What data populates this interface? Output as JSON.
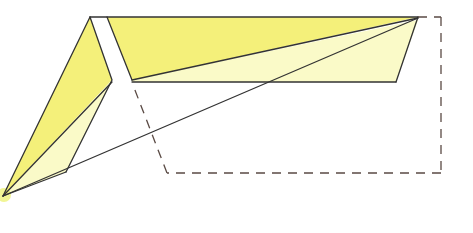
{
  "diagram": {
    "type": "origami-fold-step",
    "colors": {
      "paper_front": "#f4f07a",
      "paper_light": "#fafac8",
      "line": "#333333",
      "dashed": "#5a4a44",
      "background": "#ffffff"
    },
    "step_number": ""
  }
}
